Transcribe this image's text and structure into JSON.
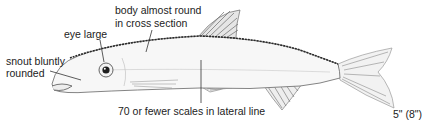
{
  "figure": {
    "labels": {
      "body": [
        "body almost round",
        "in cross section"
      ],
      "eye": "eye large",
      "snout": [
        "snout bluntly",
        "rounded"
      ],
      "scales": "70 or fewer scales in lateral line",
      "size": "5\" (8\")"
    },
    "colors": {
      "text": "#222222",
      "leader": "#333333",
      "outline": "#555555",
      "dark_back": "#2a2a2a",
      "fin": "#8a8a8a"
    }
  }
}
